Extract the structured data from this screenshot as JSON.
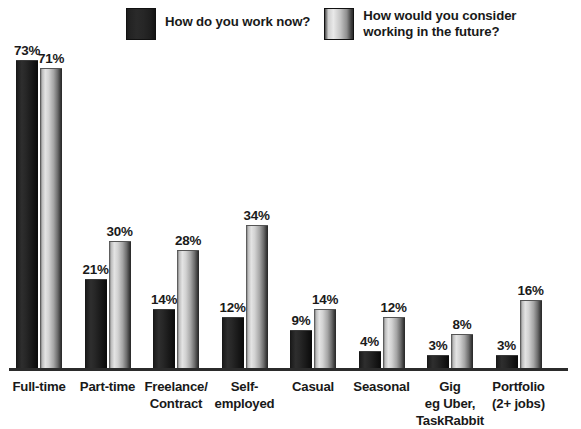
{
  "legend": {
    "entries": [
      {
        "label": "How do you work now?",
        "swatch": "dark-swatch-icon",
        "color": "#232323"
      },
      {
        "label": "How would you consider\nworking in the future?",
        "swatch": "light-gradient-swatch-icon",
        "color": "#d2d2d2"
      }
    ]
  },
  "chart_data": {
    "type": "bar",
    "title": "",
    "subtitle": "",
    "xlabel": "",
    "ylabel": "",
    "ylim": [
      0,
      78
    ],
    "grid": false,
    "legend_position": "top-center",
    "value_label_suffix": "%",
    "categories": [
      "Full-time",
      "Part-time",
      "Freelance/\nContract",
      "Self-\nemployed",
      "Casual",
      "Seasonal",
      "Gig\neg Uber,\nTaskRabbit",
      "Portfolio\n(2+ jobs)"
    ],
    "series": [
      {
        "name": "How do you work now?",
        "color": "#232323",
        "values": [
          73,
          21,
          14,
          12,
          9,
          4,
          3,
          3
        ],
        "value_labels": [
          "73%",
          "21%",
          "14%",
          "12%",
          "9%",
          "4%",
          "3%",
          "3%"
        ]
      },
      {
        "name": "How would you consider working in the future?",
        "color": "#d2d2d2",
        "values": [
          71,
          30,
          28,
          34,
          14,
          12,
          8,
          16
        ],
        "value_labels": [
          "71%",
          "30%",
          "28%",
          "34%",
          "14%",
          "12%",
          "8%",
          "16%"
        ]
      }
    ]
  },
  "layout": {
    "baseline_y": 368,
    "px_per_percent": 4.22,
    "group_start_x": 16,
    "group_pitch": 68.5,
    "bar_width": 22
  }
}
